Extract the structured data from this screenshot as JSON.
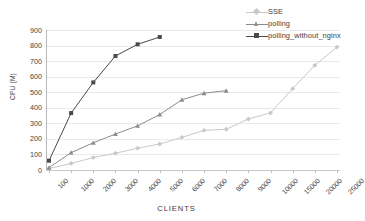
{
  "chart_data": {
    "type": "line",
    "title": "",
    "xlabel": "CLIENTS",
    "ylabel": "CPU (M)",
    "categories": [
      "100",
      "1000",
      "2000",
      "3000",
      "4000",
      "5000",
      "6000",
      "7000",
      "8000",
      "9000",
      "10000",
      "15000",
      "20000",
      "25000"
    ],
    "ylim": [
      0,
      900
    ],
    "ytick_step": 100,
    "yticks": [
      900,
      800,
      700,
      600,
      500,
      400,
      300,
      200,
      100,
      0
    ],
    "grid": true,
    "legend_position": "top-right",
    "series": [
      {
        "name": "SSE",
        "color": "#c8c8c8",
        "marker": "diamond",
        "values": [
          10,
          42,
          80,
          108,
          140,
          167,
          210,
          255,
          262,
          328,
          367,
          523,
          673,
          790
        ]
      },
      {
        "name": "polling",
        "color": "#8b8b8b",
        "marker": "triangle",
        "values": [
          15,
          112,
          175,
          231,
          284,
          357,
          452,
          494,
          510,
          null,
          null,
          null,
          null,
          null
        ]
      },
      {
        "name": "polling_without_nginx",
        "color": "#4a4a4a",
        "marker": "square",
        "values": [
          60,
          366,
          563,
          733,
          808,
          855,
          null,
          null,
          null,
          null,
          null,
          null,
          null,
          null
        ]
      }
    ]
  },
  "legend": {
    "items": [
      {
        "label": "SSE"
      },
      {
        "label": "polling"
      },
      {
        "label": "polling_without_nginx"
      }
    ]
  },
  "axes": {
    "y_title": "CPU (M)",
    "x_title": "CLIENTS"
  },
  "colors": {
    "sse": "#c8c8c8",
    "polling": "#8b8b8b",
    "polling_without_nginx": "#4a4a4a",
    "grid": "#e9e9ec",
    "axis": "#bdbdbd",
    "text": "#3f3f3f",
    "background": "#ffffff"
  }
}
